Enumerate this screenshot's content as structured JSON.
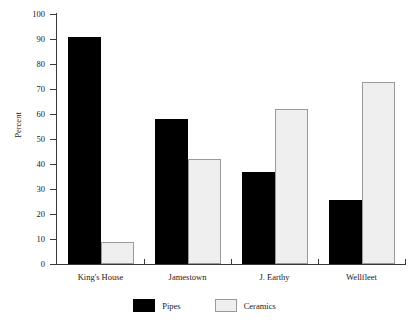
{
  "chart_data": {
    "type": "bar",
    "title": "",
    "xlabel": "",
    "ylabel": "Percent",
    "ylim": [
      0,
      100
    ],
    "ytick_values": [
      0,
      10,
      20,
      30,
      40,
      50,
      60,
      70,
      80,
      90,
      100
    ],
    "ytick_labels": [
      "0",
      "10",
      "20",
      "30",
      "40",
      "50",
      "60",
      "70",
      "80",
      "90",
      "100"
    ],
    "grid": false,
    "legend_position": "bottom-center",
    "categories": [
      "King's House",
      "Jamestown",
      "J. Earthy",
      "Wellfleet"
    ],
    "series": [
      {
        "name": "Pipes",
        "color": "#000000",
        "values": [
          91,
          58,
          37,
          25.5
        ]
      },
      {
        "name": "Ceramics",
        "color": "#efefef",
        "values": [
          9,
          42,
          62,
          73
        ]
      }
    ]
  },
  "axis": {
    "y_title": "Percent"
  },
  "legend": {
    "items": [
      {
        "label": "Pipes"
      },
      {
        "label": "Ceramics"
      }
    ]
  },
  "header": {
    "cropped_title": ""
  }
}
